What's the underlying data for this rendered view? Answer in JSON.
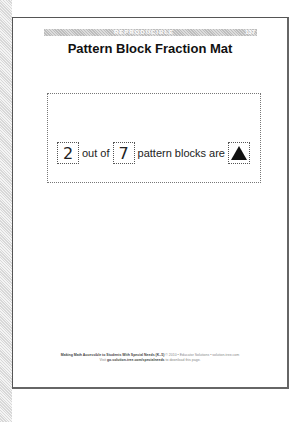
{
  "header": {
    "banner_label": "REPRODUCIBLE",
    "page_number": "137",
    "title": "Pattern Block Fraction Mat"
  },
  "mat": {
    "numerator": "2",
    "connector": "out of",
    "denominator": "7",
    "phrase": "pattern blocks are",
    "shape": "triangle",
    "shape_color": "#111111"
  },
  "footer": {
    "line1_bold": "Making Math Accessible to Students With Special Needs (K–5)",
    "line1_rest": "© 2010 • Educator Solutions • solution-tree.com",
    "line2_prefix": "Visit",
    "line2_link": "go.solution-tree.com/specialneeds",
    "line2_suffix": "to download this page."
  }
}
